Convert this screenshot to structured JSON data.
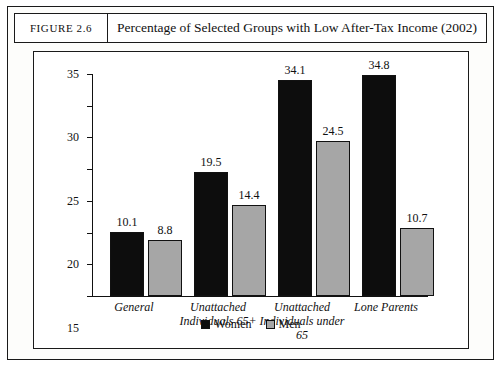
{
  "figure": {
    "label": "FIGURE 2.6",
    "title": "Percentage of Selected Groups with Low After-Tax Income (2002)"
  },
  "chart_data": {
    "type": "bar",
    "title": "Percentage of Selected Groups with Low After-Tax Income (2002)",
    "xlabel": "",
    "ylabel": "",
    "ylim": [
      0,
      35
    ],
    "yticks": [
      0,
      5,
      10,
      15,
      20,
      25,
      30,
      35
    ],
    "grid": false,
    "legend_position": "bottom",
    "categories": [
      "General",
      "Unattached Individuals 65+",
      "Unattached Individuals under 65",
      "Lone Parents"
    ],
    "category_lines": [
      [
        "General"
      ],
      [
        "Unattached",
        "Individuals 65+"
      ],
      [
        "Unattached",
        "Individuals under",
        "65"
      ],
      [
        "Lone Parents"
      ]
    ],
    "series": [
      {
        "name": "Women",
        "color": "#0d0d0d",
        "values": [
          10.1,
          19.5,
          34.1,
          34.8
        ],
        "labels": [
          "10.1",
          "19.5",
          "34.1",
          "34.8"
        ]
      },
      {
        "name": "Men",
        "color": "#a6a6a6",
        "values": [
          8.8,
          14.4,
          24.5,
          10.7
        ],
        "labels": [
          "8.8",
          "14.4",
          "24.5",
          "10.7"
        ]
      }
    ]
  }
}
